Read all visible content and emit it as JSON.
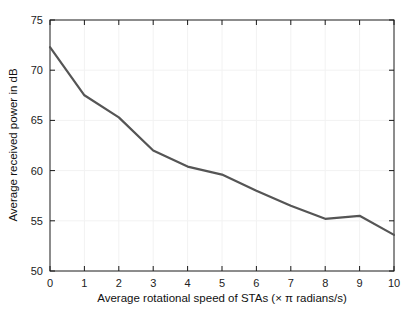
{
  "chart_data": {
    "type": "line",
    "title": "",
    "xlabel": "Average rotational speed of STAs (× π radians/s)",
    "ylabel": "Average received power in dB",
    "x": [
      0,
      1,
      2,
      3,
      4,
      5,
      6,
      7,
      8,
      9,
      10
    ],
    "values": [
      72.3,
      67.5,
      65.3,
      62.0,
      60.4,
      59.6,
      58.0,
      56.5,
      55.2,
      55.5,
      53.6
    ],
    "series": [
      {
        "name": "Average received power",
        "values": [
          72.3,
          67.5,
          65.3,
          62.0,
          60.4,
          59.6,
          58.0,
          56.5,
          55.2,
          55.5,
          53.6
        ],
        "color": "#555555"
      }
    ],
    "xlim": [
      0,
      10
    ],
    "ylim": [
      50,
      75
    ],
    "xticks": [
      0,
      1,
      2,
      3,
      4,
      5,
      6,
      7,
      8,
      9,
      10
    ],
    "yticks": [
      50,
      55,
      60,
      65,
      70,
      75
    ],
    "xtick_labels": [
      "0",
      "1",
      "2",
      "3",
      "4",
      "5",
      "6",
      "7",
      "8",
      "9",
      "10"
    ],
    "ytick_labels": [
      "50",
      "55",
      "60",
      "65",
      "70",
      "75"
    ],
    "grid": true,
    "grid_color": "#f2f2f2",
    "legend": null,
    "legend_position": "none",
    "axis_color": "#1a1a1a",
    "background": "#ffffff",
    "line_width": 2.2
  }
}
